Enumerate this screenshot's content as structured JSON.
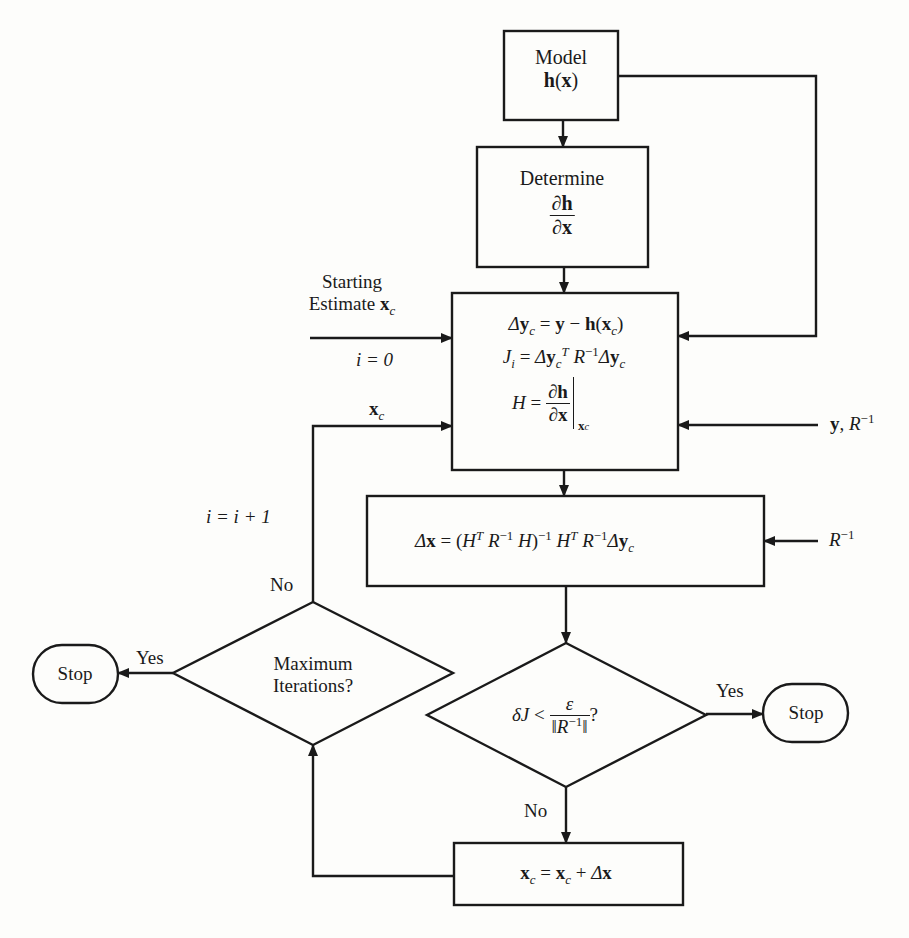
{
  "diagram": {
    "type": "flowchart",
    "stroke_color": "#1a1a1a",
    "background_color": "#fdfdfb"
  },
  "nodes": {
    "model": {
      "shape": "rectangle",
      "line1": "Model",
      "line2_func": "h",
      "line2_arg": "x"
    },
    "determine": {
      "shape": "rectangle",
      "line1": "Determine",
      "num": "∂h",
      "den": "∂x"
    },
    "compute": {
      "shape": "rectangle",
      "eq1": "Δy_c = y − h(x_c)",
      "eq2": "J_i = Δy_c^T R^−1 Δy_c",
      "eq3": "H = ∂h/∂x |_{x_c}"
    },
    "update_delta": {
      "shape": "rectangle",
      "equation": "Δx = (H^T R^−1 H)^−1 H^T R^−1 Δy_c"
    },
    "convergence_check": {
      "shape": "diamond",
      "condition": "δJ < ε / ‖R^−1‖ ?"
    },
    "max_iterations": {
      "shape": "diamond",
      "line1": "Maximum",
      "line2": "Iterations?"
    },
    "update_state": {
      "shape": "rectangle",
      "equation": "x_c = x_c + Δx"
    },
    "stop_left": {
      "shape": "terminator",
      "label": "Stop"
    },
    "stop_right": {
      "shape": "terminator",
      "label": "Stop"
    }
  },
  "inputs": {
    "starting_estimate": {
      "line1": "Starting",
      "line2": "Estimate",
      "var": "x",
      "sub": "c",
      "init": "i = 0"
    },
    "measurements": {
      "label": "y, R^−1"
    },
    "weights": {
      "label": "R^−1"
    },
    "feedback": {
      "var": "x",
      "sub": "c",
      "increment": "i = i + 1"
    }
  },
  "edges": {
    "convergence_yes": "Yes",
    "convergence_no": "No",
    "max_iter_yes": "Yes",
    "max_iter_no": "No"
  },
  "symbols": {
    "delta": "Δ",
    "partial": "∂",
    "small_delta": "δ",
    "epsilon": "ε",
    "minus_one": "−1",
    "transpose": "T",
    "equals": "=",
    "minus": "−",
    "plus": "+",
    "less": "<",
    "question": "?",
    "norm": "‖",
    "comma": ","
  }
}
